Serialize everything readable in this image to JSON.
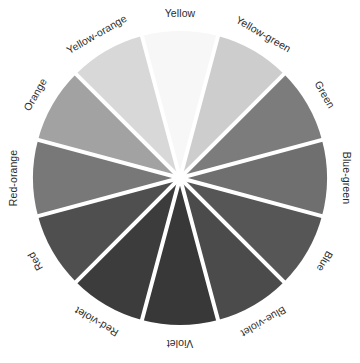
{
  "figure": {
    "background_color": "#ffffff"
  },
  "chart_data": {
    "type": "pie",
    "xlabel": "",
    "ylabel": "",
    "legend_position": "none",
    "grid": false,
    "center": {
      "x": 180,
      "y": 178
    },
    "radius": 147,
    "slice_count": 12,
    "slice_angle_degrees": 30,
    "divider_color": "#ffffff",
    "divider_width_px": 4,
    "categories": [
      "Yellow",
      "Yellow-green",
      "Green",
      "Blue-green",
      "Blue",
      "Blue-violet",
      "Violet",
      "Red-violet",
      "Red",
      "Red-orange",
      "Orange",
      "Yellow-orange"
    ],
    "values": [
      8.333,
      8.333,
      8.333,
      8.333,
      8.333,
      8.333,
      8.333,
      8.333,
      8.333,
      8.333,
      8.333,
      8.333
    ],
    "colors": [
      "#f7f7f7",
      "#cdcdcd",
      "#7c7c7c",
      "#6f6f6f",
      "#565656",
      "#4b4b4b",
      "#383838",
      "#3c3c3c",
      "#4f4f4f",
      "#787878",
      "#a2a2a2",
      "#d8d8d8"
    ],
    "segments": [
      {
        "label": "Yellow",
        "color": "#f7f7f7",
        "start_angle": -15,
        "end_angle": 15,
        "mid_angle": 0,
        "label_rotation": 0,
        "label_x": 180,
        "label_y": 14
      },
      {
        "label": "Yellow-green",
        "color": "#cdcdcd",
        "start_angle": 15,
        "end_angle": 45,
        "mid_angle": 30,
        "label_rotation": 30,
        "label_x": 263,
        "label_y": 35
      },
      {
        "label": "Green",
        "color": "#7c7c7c",
        "start_angle": 45,
        "end_angle": 75,
        "mid_angle": 60,
        "label_rotation": 60,
        "label_x": 324,
        "label_y": 95
      },
      {
        "label": "Blue-green",
        "color": "#6f6f6f",
        "start_angle": 75,
        "end_angle": 105,
        "mid_angle": 90,
        "label_rotation": 90,
        "label_x": 346,
        "label_y": 178
      },
      {
        "label": "Blue",
        "color": "#565656",
        "start_angle": 105,
        "end_angle": 135,
        "mid_angle": 120,
        "label_rotation": 120,
        "label_x": 324,
        "label_y": 261
      },
      {
        "label": "Blue-violet",
        "color": "#4b4b4b",
        "start_angle": 135,
        "end_angle": 165,
        "mid_angle": 150,
        "label_rotation": 150,
        "label_x": 263,
        "label_y": 321
      },
      {
        "label": "Violet",
        "color": "#383838",
        "start_angle": 165,
        "end_angle": 195,
        "mid_angle": 180,
        "label_rotation": 180,
        "label_x": 180,
        "label_y": 343
      },
      {
        "label": "Red-violet",
        "color": "#3c3c3c",
        "start_angle": 195,
        "end_angle": 225,
        "mid_angle": 210,
        "label_rotation": 210,
        "label_x": 97,
        "label_y": 321
      },
      {
        "label": "Red",
        "color": "#4f4f4f",
        "start_angle": 225,
        "end_angle": 255,
        "mid_angle": 240,
        "label_rotation": 240,
        "label_x": 36,
        "label_y": 261
      },
      {
        "label": "Red-orange",
        "color": "#787878",
        "start_angle": 255,
        "end_angle": 285,
        "mid_angle": 270,
        "label_rotation": 270,
        "label_x": 14,
        "label_y": 178
      },
      {
        "label": "Orange",
        "color": "#a2a2a2",
        "start_angle": 285,
        "end_angle": 315,
        "mid_angle": 300,
        "label_rotation": 300,
        "label_x": 36,
        "label_y": 95
      },
      {
        "label": "Yellow-orange",
        "color": "#d8d8d8",
        "start_angle": 315,
        "end_angle": 345,
        "mid_angle": 330,
        "label_rotation": 330,
        "label_x": 97,
        "label_y": 35
      }
    ]
  }
}
